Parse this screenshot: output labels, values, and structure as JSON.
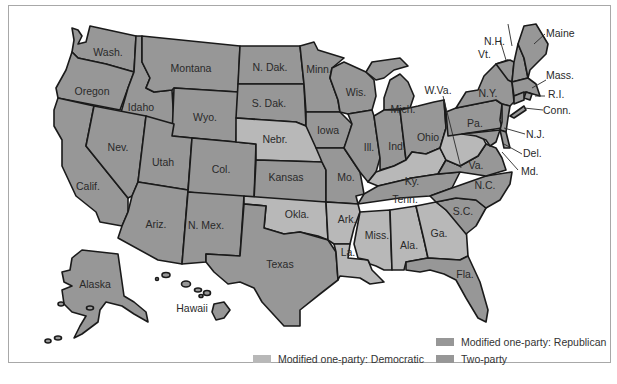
{
  "colors": {
    "democratic": "#b8b8b8",
    "republican": "#979797",
    "two_party": "#979797",
    "border": "#1a1a1a",
    "frame": "#a8a8a8"
  },
  "legend": {
    "items": [
      {
        "key": "republican",
        "label": "Modified one-party: Republican",
        "color": "#979797"
      },
      {
        "key": "democratic",
        "label": "Modified one-party: Democratic",
        "color": "#b8b8b8"
      },
      {
        "key": "two_party",
        "label": "Two-party",
        "color": "#979797"
      }
    ]
  },
  "labels": {
    "wash": "Wash.",
    "oregon": "Oregon",
    "calif": "Calif.",
    "idaho": "Idaho",
    "nev": "Nev.",
    "montana": "Montana",
    "wyo": "Wyo.",
    "utah": "Utah",
    "ariz": "Ariz.",
    "col": "Col.",
    "nmex": "N. Mex.",
    "ndak": "N. Dak.",
    "sdak": "S. Dak.",
    "nebr": "Nebr.",
    "kansas": "Kansas",
    "okla": "Okla.",
    "texas": "Texas",
    "minn": "Minn.",
    "iowa": "Iowa",
    "mo": "Mo.",
    "ark": "Ark.",
    "la": "La.",
    "wis": "Wis.",
    "ill": "Ill.",
    "mich": "Mich.",
    "ind": "Ind.",
    "ohio": "Ohio",
    "ky": "Ky.",
    "tenn": "Tenn.",
    "miss": "Miss.",
    "ala": "Ala.",
    "ga": "Ga.",
    "fla": "Fla.",
    "sc": "S.C.",
    "nc": "N.C.",
    "va": "Va.",
    "wva": "W.Va.",
    "pa": "Pa.",
    "ny": "N.Y.",
    "vt": "Vt.",
    "nh": "N.H.",
    "maine": "Maine",
    "mass": "Mass.",
    "ri": "R.I.",
    "conn": "Conn.",
    "nj": "N.J.",
    "del": "Del.",
    "md": "Md.",
    "alaska": "Alaska",
    "hawaii": "Hawaii"
  }
}
